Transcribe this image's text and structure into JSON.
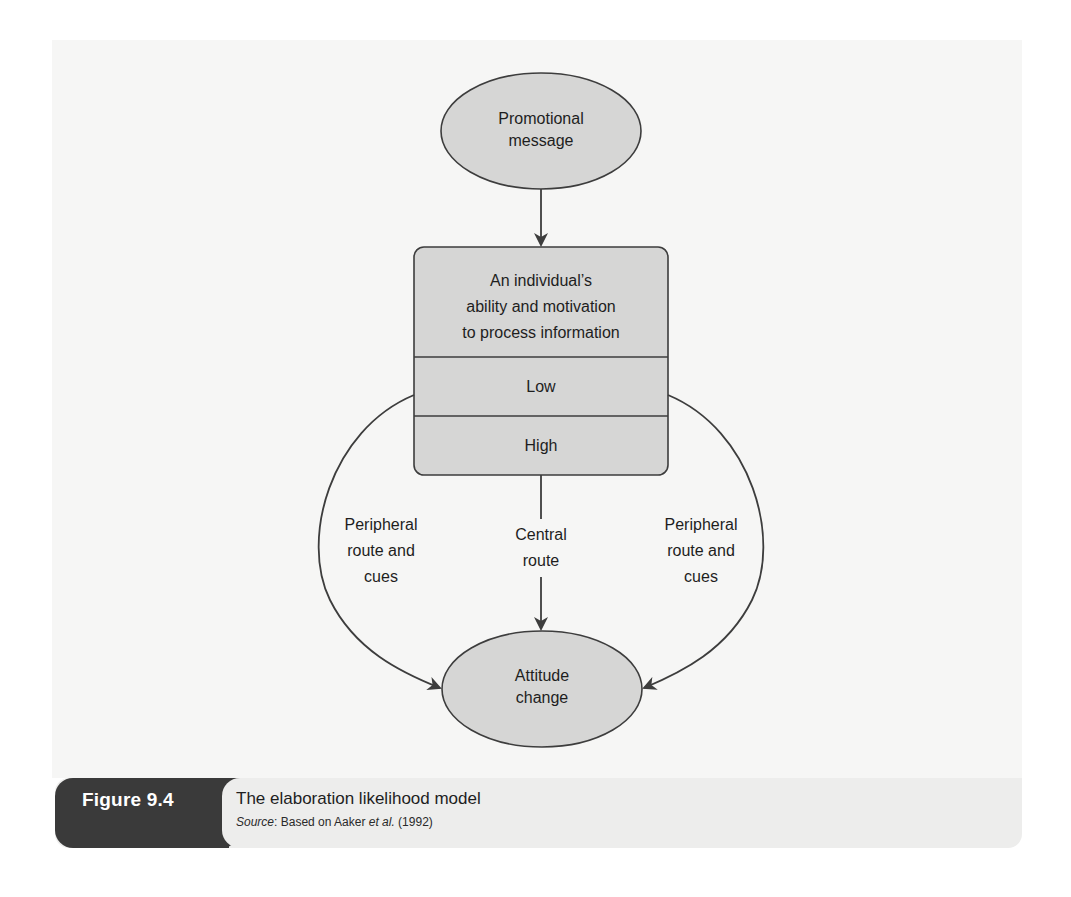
{
  "figure": {
    "number": "Figure 9.4",
    "title": "The elaboration likelihood model",
    "source_label": "Source",
    "source_sep": ": Based on Aaker ",
    "source_etal": "et al.",
    "source_year": " (1992)"
  },
  "nodes": {
    "promotional_message": "Promotional\nmessage",
    "processing_box": {
      "header": "An individual’s\nability and motivation\nto process information",
      "low": "Low",
      "high": "High"
    },
    "attitude_change": "Attitude\nchange"
  },
  "edges": {
    "left_route": "Peripheral\nroute and\ncues",
    "central_route": "Central\nroute",
    "right_route": "Peripheral\nroute and\ncues"
  },
  "colors": {
    "node_fill": "#d6d6d5",
    "stroke": "#3d3d3d",
    "panel_bg": "#f6f6f5",
    "caption_tab": "#3a3a3a",
    "caption_bg": "#ededec"
  }
}
